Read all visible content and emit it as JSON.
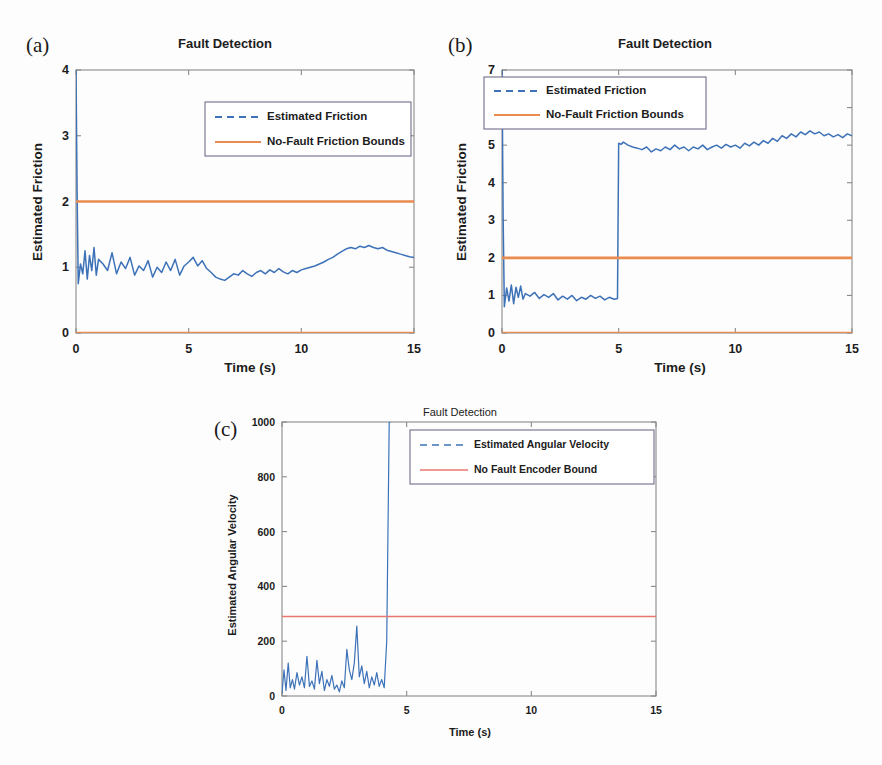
{
  "figure": {
    "background": "#fdfdfd",
    "trace_color": "#3d72b8",
    "bound_color_orange": "#ea8b4f",
    "bound_color_red": "#e8786f",
    "axis_color": "#8a8a8a"
  },
  "panels": [
    {
      "letter": "(a)",
      "title": "Fault Detection",
      "xlabel": "Time (s)",
      "ylabel": "Estimated Friction",
      "legend": [
        {
          "label": "Estimated Friction",
          "style": "dashed",
          "color": "#3d72b8"
        },
        {
          "label": "No-Fault Friction Bounds",
          "style": "solid",
          "color": "#ea8b4f"
        }
      ]
    },
    {
      "letter": "(b)",
      "title": "Fault Detection",
      "xlabel": "Time (s)",
      "ylabel": "Estimated Friction",
      "legend": [
        {
          "label": "Estimated Friction",
          "style": "dashed",
          "color": "#3d72b8"
        },
        {
          "label": "No-Fault Friction Bounds",
          "style": "solid",
          "color": "#ea8b4f"
        }
      ]
    },
    {
      "letter": "(c)",
      "title": "Fault Detection",
      "xlabel": "Time (s)",
      "ylabel": "Estimated Angular Velocity",
      "legend": [
        {
          "label": "Estimated Angular Velocity",
          "style": "dashed",
          "color": "#3d72b8"
        },
        {
          "label": "No Fault Encoder Bound",
          "style": "solid",
          "color": "#e8786f"
        }
      ]
    }
  ],
  "chart_data": [
    {
      "id": "a",
      "type": "line",
      "title": "Fault Detection",
      "xlabel": "Time (s)",
      "ylabel": "Estimated Friction",
      "xlim": [
        0,
        15
      ],
      "ylim": [
        0,
        4
      ],
      "xticks": [
        0,
        5,
        10,
        15
      ],
      "yticks": [
        0,
        1,
        2,
        3,
        4
      ],
      "grid": false,
      "legend_position": "upper-center",
      "series": [
        {
          "name": "Estimated Friction",
          "style": "dashed",
          "color": "#3d72b8",
          "comment": "Noisy friction estimate; starts at 4 (initialization spike down to ~0.7), settles around 1.0, dips to ~0.85 around t=7-10, rises to ~1.3 plateau at t=12-14, ends ~1.15",
          "x": [
            0,
            0.05,
            0.1,
            0.2,
            0.3,
            0.4,
            0.5,
            0.6,
            0.7,
            0.8,
            0.9,
            1.0,
            1.2,
            1.4,
            1.6,
            1.8,
            2.0,
            2.2,
            2.4,
            2.6,
            2.8,
            3.0,
            3.2,
            3.4,
            3.6,
            3.8,
            4.0,
            4.2,
            4.4,
            4.6,
            4.8,
            5.0,
            5.2,
            5.4,
            5.6,
            5.8,
            6.0,
            6.2,
            6.4,
            6.6,
            6.8,
            7.0,
            7.2,
            7.4,
            7.6,
            7.8,
            8.0,
            8.2,
            8.4,
            8.6,
            8.8,
            9.0,
            9.2,
            9.4,
            9.6,
            9.8,
            10.0,
            10.2,
            10.4,
            10.6,
            10.8,
            11.0,
            11.2,
            11.4,
            11.6,
            11.8,
            12.0,
            12.2,
            12.4,
            12.6,
            12.8,
            13.0,
            13.2,
            13.4,
            13.6,
            13.8,
            14.0,
            14.2,
            14.4,
            14.6,
            14.8,
            15.0
          ],
          "y": [
            4.0,
            2.1,
            0.75,
            1.05,
            0.9,
            1.25,
            0.82,
            1.18,
            0.95,
            1.3,
            0.88,
            1.12,
            1.05,
            0.95,
            1.22,
            0.9,
            1.08,
            0.98,
            1.15,
            0.88,
            1.02,
            0.95,
            1.1,
            0.85,
            1.0,
            0.92,
            1.08,
            0.95,
            1.12,
            0.88,
            1.02,
            1.08,
            1.15,
            1.02,
            1.1,
            0.98,
            0.92,
            0.85,
            0.82,
            0.8,
            0.85,
            0.9,
            0.88,
            0.95,
            0.9,
            0.86,
            0.92,
            0.95,
            0.9,
            0.96,
            0.92,
            0.98,
            0.93,
            0.9,
            0.95,
            0.92,
            0.96,
            0.98,
            1.0,
            1.02,
            1.05,
            1.08,
            1.12,
            1.15,
            1.2,
            1.24,
            1.28,
            1.3,
            1.28,
            1.32,
            1.3,
            1.33,
            1.3,
            1.28,
            1.3,
            1.26,
            1.24,
            1.22,
            1.2,
            1.18,
            1.16,
            1.15
          ]
        },
        {
          "name": "No-Fault Friction Bounds (upper)",
          "style": "solid",
          "color": "#ea8b4f",
          "value": 2.0
        },
        {
          "name": "No-Fault Friction Bounds (lower)",
          "style": "solid",
          "color": "#ea8b4f",
          "value": 0.0
        }
      ]
    },
    {
      "id": "b",
      "type": "line",
      "title": "Fault Detection",
      "xlabel": "Time (s)",
      "ylabel": "Estimated Friction",
      "xlim": [
        0,
        15
      ],
      "ylim": [
        0,
        7
      ],
      "xticks": [
        0,
        5,
        10,
        15
      ],
      "yticks": [
        0,
        1,
        2,
        3,
        4,
        5,
        6,
        7
      ],
      "grid": false,
      "legend_position": "upper-left",
      "series": [
        {
          "name": "Estimated Friction",
          "style": "dashed",
          "color": "#3d72b8",
          "comment": "Noisy estimate near 1.0 until t=5, then abrupt step to ~5.05, drifting slightly upward to ~5.3 by t=13-15",
          "x": [
            0,
            0.05,
            0.1,
            0.2,
            0.3,
            0.4,
            0.5,
            0.6,
            0.7,
            0.8,
            0.9,
            1.0,
            1.2,
            1.4,
            1.6,
            1.8,
            2.0,
            2.2,
            2.4,
            2.6,
            2.8,
            3.0,
            3.2,
            3.4,
            3.6,
            3.8,
            4.0,
            4.2,
            4.4,
            4.6,
            4.8,
            4.95,
            5.0,
            5.1,
            5.2,
            5.4,
            5.6,
            5.8,
            6.0,
            6.2,
            6.4,
            6.6,
            6.8,
            7.0,
            7.2,
            7.4,
            7.6,
            7.8,
            8.0,
            8.2,
            8.4,
            8.6,
            8.8,
            9.0,
            9.2,
            9.4,
            9.6,
            9.8,
            10.0,
            10.2,
            10.4,
            10.6,
            10.8,
            11.0,
            11.2,
            11.4,
            11.6,
            11.8,
            12.0,
            12.2,
            12.4,
            12.6,
            12.8,
            13.0,
            13.2,
            13.4,
            13.6,
            13.8,
            14.0,
            14.2,
            14.4,
            14.6,
            14.8,
            15.0
          ],
          "y": [
            7.0,
            3.0,
            0.7,
            1.2,
            0.85,
            1.28,
            0.78,
            1.22,
            0.95,
            1.25,
            0.9,
            1.05,
            0.98,
            1.08,
            0.92,
            1.02,
            0.95,
            1.05,
            0.88,
            0.98,
            0.9,
            1.0,
            0.86,
            0.95,
            0.9,
            1.0,
            0.92,
            0.98,
            0.88,
            0.95,
            0.9,
            0.92,
            5.05,
            5.02,
            5.08,
            5.0,
            4.95,
            4.92,
            4.88,
            4.95,
            4.82,
            4.9,
            4.85,
            4.95,
            4.88,
            5.0,
            4.9,
            4.95,
            4.85,
            4.95,
            4.9,
            5.0,
            4.88,
            4.95,
            5.0,
            4.92,
            5.02,
            4.95,
            5.0,
            4.92,
            5.05,
            4.98,
            5.08,
            5.0,
            5.12,
            5.05,
            5.18,
            5.1,
            5.25,
            5.18,
            5.3,
            5.22,
            5.35,
            5.28,
            5.38,
            5.3,
            5.35,
            5.25,
            5.3,
            5.22,
            5.28,
            5.2,
            5.3,
            5.25
          ]
        },
        {
          "name": "No-Fault Friction Bounds (upper)",
          "style": "solid",
          "color": "#ea8b4f",
          "value": 2.0
        },
        {
          "name": "No-Fault Friction Bounds (lower)",
          "style": "solid",
          "color": "#ea8b4f",
          "value": 0.0
        }
      ]
    },
    {
      "id": "c",
      "type": "line",
      "title": "Fault Detection",
      "xlabel": "Time (s)",
      "ylabel": "Estimated Angular Velocity",
      "xlim": [
        0,
        15
      ],
      "ylim": [
        0,
        1000
      ],
      "xticks": [
        0,
        5,
        10,
        15
      ],
      "yticks": [
        0,
        200,
        400,
        600,
        800,
        1000
      ],
      "grid": false,
      "legend_position": "upper-right",
      "series": [
        {
          "name": "Estimated Angular Velocity",
          "style": "dashed",
          "color": "#3d72b8",
          "comment": "Spiky low-amplitude signal (0-260) until t~4.3, then a near-vertical excursion beyond 1000",
          "x": [
            0,
            0.08,
            0.16,
            0.25,
            0.33,
            0.42,
            0.5,
            0.6,
            0.7,
            0.8,
            0.9,
            1.0,
            1.1,
            1.2,
            1.3,
            1.4,
            1.5,
            1.6,
            1.7,
            1.8,
            1.9,
            2.0,
            2.1,
            2.2,
            2.3,
            2.4,
            2.5,
            2.6,
            2.7,
            2.8,
            2.9,
            3.0,
            3.1,
            3.2,
            3.3,
            3.4,
            3.5,
            3.6,
            3.7,
            3.8,
            3.9,
            4.0,
            4.1,
            4.2,
            4.25,
            4.3,
            4.35
          ],
          "y": [
            10,
            95,
            20,
            120,
            30,
            60,
            25,
            85,
            40,
            70,
            30,
            145,
            35,
            55,
            25,
            130,
            45,
            90,
            20,
            60,
            35,
            75,
            25,
            40,
            15,
            55,
            30,
            170,
            95,
            60,
            120,
            255,
            70,
            110,
            45,
            90,
            30,
            70,
            40,
            85,
            35,
            60,
            30,
            200,
            600,
            1000,
            1000
          ]
        },
        {
          "name": "No Fault Encoder Bound",
          "style": "solid",
          "color": "#e8786f",
          "value": 290
        }
      ]
    }
  ]
}
